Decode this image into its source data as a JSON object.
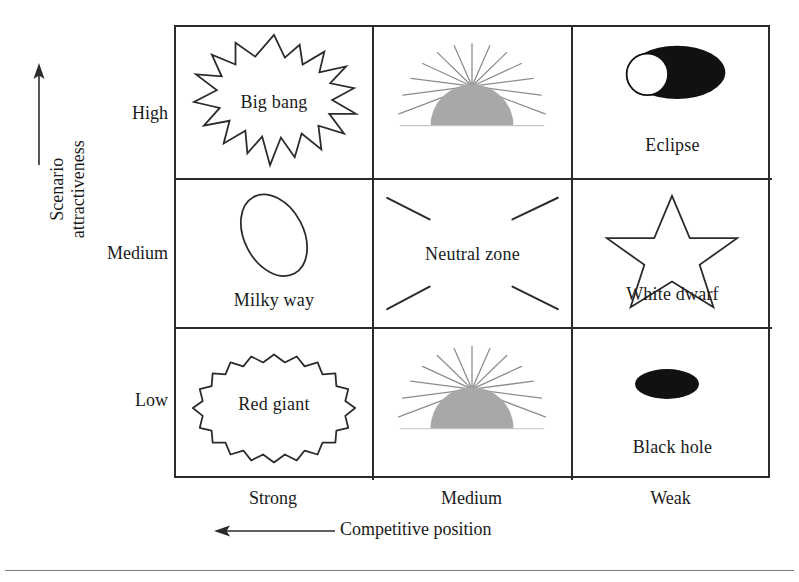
{
  "figure": {
    "y_axis": {
      "title": "Scenario\nattractiveness",
      "arrow_icon": "up-arrow-icon",
      "categories": [
        "High",
        "Medium",
        "Low"
      ]
    },
    "x_axis": {
      "title": "Competitive position",
      "arrow_icon": "left-arrow-icon",
      "categories": [
        "Strong",
        "Medium",
        "Weak"
      ]
    },
    "colors": {
      "line": "#2b2b2b",
      "text": "#1a1a1a",
      "sun_fill": "#a8a8a8",
      "sun_ray": "#8d8d8d",
      "solid_black": "#111111",
      "rule": "#7d7d7d"
    },
    "cells": [
      {
        "row": "High",
        "col": "Strong",
        "label": "Big bang",
        "label_position": "inside",
        "icon": "explosion-burst-icon"
      },
      {
        "row": "High",
        "col": "Medium",
        "label": "",
        "label_position": "none",
        "icon": "rising-sun-icon"
      },
      {
        "row": "High",
        "col": "Weak",
        "label": "Eclipse",
        "label_position": "below",
        "icon": "eclipse-icon"
      },
      {
        "row": "Medium",
        "col": "Strong",
        "label": "Milky way",
        "label_position": "below",
        "icon": "tilted-ellipse-icon"
      },
      {
        "row": "Medium",
        "col": "Medium",
        "label": "Neutral zone",
        "label_position": "middle",
        "icon": "four-diagonal-rays-icon"
      },
      {
        "row": "Medium",
        "col": "Weak",
        "label": "White dwarf",
        "label_position": "below",
        "icon": "star-outline-icon"
      },
      {
        "row": "Low",
        "col": "Strong",
        "label": "Red giant",
        "label_position": "inside",
        "icon": "scalloped-ellipse-icon"
      },
      {
        "row": "Low",
        "col": "Medium",
        "label": "",
        "label_position": "none",
        "icon": "rising-sun-icon"
      },
      {
        "row": "Low",
        "col": "Weak",
        "label": "Black hole",
        "label_position": "below",
        "icon": "filled-ellipse-icon"
      }
    ]
  }
}
